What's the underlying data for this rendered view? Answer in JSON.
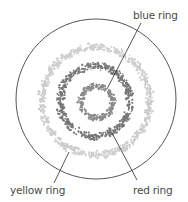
{
  "diagram": {
    "type": "concentric-rings",
    "canvas": {
      "width": 188,
      "height": 202,
      "background": "#ffffff"
    },
    "outer_circle": {
      "cx": 96,
      "cy": 99,
      "r": 80,
      "stroke": "#555555",
      "stroke_width": 1
    },
    "rings": [
      {
        "id": "blue",
        "label": "blue ring",
        "cx": 97,
        "cy": 102,
        "r": 16,
        "thickness": 5,
        "color": "#8a8a8a",
        "dots": 260
      },
      {
        "id": "red",
        "label": "red ring",
        "cx": 95,
        "cy": 101,
        "r": 35,
        "thickness": 6,
        "color": "#777777",
        "dots": 560
      },
      {
        "id": "yellow",
        "label": "yellow ring",
        "cx": 96,
        "cy": 101,
        "r": 54,
        "thickness": 6,
        "color": "#cdcdcd",
        "dots": 820
      }
    ],
    "callouts": [
      {
        "ring": "blue",
        "text": "blue ring",
        "text_x": 133,
        "text_y": 19,
        "line": [
          141,
          23,
          107,
          89
        ]
      },
      {
        "ring": "red",
        "text": "red ring",
        "text_x": 133,
        "text_y": 194,
        "line": [
          112,
          133,
          137,
          180
        ]
      },
      {
        "ring": "yellow",
        "text": "yellow ring",
        "text_x": 10,
        "text_y": 194,
        "line": [
          69,
          152,
          54,
          183
        ]
      }
    ],
    "line_color": "#444444"
  }
}
